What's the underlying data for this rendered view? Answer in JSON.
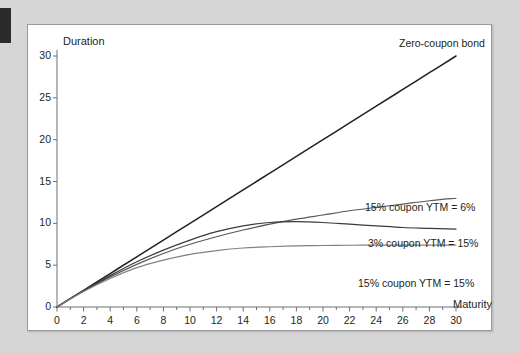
{
  "accent": {
    "color": "#2b2b2b"
  },
  "figure": {
    "background": "#ffffff",
    "border_color": "#9a9a9a"
  },
  "chart_data": {
    "type": "line",
    "title": "",
    "xlabel": "Maturity",
    "ylabel": "Duration",
    "xlim": [
      0,
      30
    ],
    "ylim": [
      0,
      30
    ],
    "xticks": [
      0,
      2,
      4,
      6,
      8,
      10,
      12,
      14,
      16,
      18,
      20,
      22,
      24,
      26,
      28,
      30
    ],
    "yticks": [
      0,
      5,
      10,
      15,
      20,
      25,
      30
    ],
    "minor_xtick_interval": 1,
    "grid": false,
    "legend": "inline-annotations",
    "series": [
      {
        "name": "Zero-coupon bond",
        "color": "#231f20",
        "label_position": "top-right",
        "x": [
          0,
          2,
          4,
          6,
          8,
          10,
          12,
          14,
          16,
          18,
          20,
          22,
          24,
          26,
          28,
          30
        ],
        "values": [
          0,
          2,
          4,
          6,
          8,
          10,
          12,
          14,
          16,
          18,
          20,
          22,
          24,
          26,
          28,
          30
        ]
      },
      {
        "name": "15% coupon YTM = 6%",
        "color": "#58595b",
        "label_position": "right-upper",
        "x": [
          0,
          2,
          4,
          6,
          8,
          10,
          12,
          14,
          16,
          18,
          20,
          22,
          24,
          26,
          28,
          30
        ],
        "values": [
          0,
          1.9,
          3.6,
          5.1,
          6.4,
          7.5,
          8.4,
          9.2,
          9.9,
          10.5,
          11.0,
          11.5,
          11.9,
          12.3,
          12.7,
          13.0
        ]
      },
      {
        "name": "3% coupon YTM = 15%",
        "color": "#3a3a3a",
        "label_position": "right-middle",
        "x": [
          0,
          2,
          4,
          6,
          8,
          10,
          12,
          14,
          16,
          18,
          20,
          22,
          24,
          26,
          28,
          30
        ],
        "values": [
          0,
          1.95,
          3.75,
          5.4,
          6.8,
          8.0,
          9.0,
          9.7,
          10.1,
          10.2,
          10.1,
          9.9,
          9.7,
          9.5,
          9.4,
          9.3
        ]
      },
      {
        "name": "15% coupon YTM = 15%",
        "color": "#808285",
        "label_position": "right-lower",
        "x": [
          0,
          2,
          4,
          6,
          8,
          10,
          12,
          14,
          16,
          18,
          20,
          22,
          24,
          26,
          28,
          30
        ],
        "values": [
          0,
          1.85,
          3.4,
          4.7,
          5.6,
          6.3,
          6.75,
          7.05,
          7.2,
          7.3,
          7.35,
          7.38,
          7.4,
          7.4,
          7.4,
          7.4
        ]
      }
    ],
    "annotations": [
      {
        "text": "Zero-coupon bond",
        "series": "Zero-coupon bond"
      },
      {
        "text": "15% coupon YTM = 6%",
        "series": "15% coupon YTM = 6%"
      },
      {
        "text": "3% coupon YTM = 15%",
        "series": "3% coupon YTM = 15%"
      },
      {
        "text": "15% coupon YTM = 15%",
        "series": "15% coupon YTM = 15%"
      }
    ]
  }
}
